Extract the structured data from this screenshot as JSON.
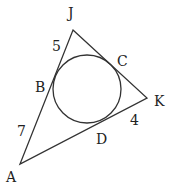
{
  "diagram": {
    "type": "triangle-incircle",
    "vertices": {
      "J": {
        "label": "J",
        "x": 73,
        "y": 30
      },
      "K": {
        "label": "K",
        "x": 147,
        "y": 98
      },
      "A": {
        "label": "A",
        "x": 20,
        "y": 164
      }
    },
    "tangent_points": {
      "B": {
        "label": "B"
      },
      "C": {
        "label": "C"
      },
      "D": {
        "label": "D"
      }
    },
    "circle": {
      "cx": 87,
      "cy": 90,
      "r": 34
    },
    "segment_lengths": {
      "JB": "5",
      "AB": "7",
      "KD": "4"
    },
    "stroke_color": "#333333"
  }
}
